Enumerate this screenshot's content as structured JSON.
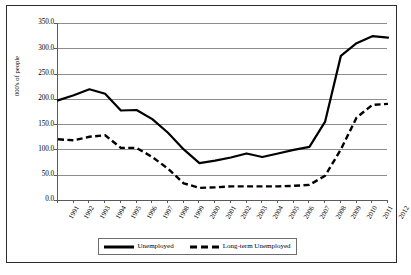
{
  "chart_data": {
    "type": "line",
    "title": "",
    "xlabel": "",
    "ylabel": "000's of people",
    "ylim": [
      0,
      350
    ],
    "ytick_step": 50,
    "grid": true,
    "legend_position": "bottom",
    "categories": [
      "1991",
      "1992",
      "1993",
      "1994",
      "1995",
      "1996",
      "1997",
      "1998",
      "1999",
      "2000",
      "2001",
      "2002",
      "2003",
      "2004",
      "2005",
      "2006",
      "2007",
      "2008",
      "2009",
      "2010",
      "2011",
      "2012"
    ],
    "ytick_labels": [
      "0.0",
      "50.0",
      "100.0",
      "150.0",
      "200.0",
      "250.0",
      "300.0",
      "350.0"
    ],
    "series": [
      {
        "name": "Unemployed",
        "style": "solid",
        "color": "#000000",
        "values": [
          197,
          207,
          219,
          210,
          177,
          178,
          160,
          133,
          100,
          73,
          78,
          84,
          92,
          85,
          92,
          99,
          105,
          155,
          285,
          310,
          324,
          321
        ]
      },
      {
        "name": "Long-term Unemployed",
        "style": "dashed",
        "color": "#000000",
        "values": [
          120,
          118,
          125,
          128,
          103,
          103,
          85,
          62,
          33,
          24,
          25,
          27,
          27,
          27,
          27,
          28,
          30,
          48,
          100,
          163,
          188,
          190
        ]
      }
    ]
  },
  "legend": {
    "entries": [
      {
        "label": "Unemployed"
      },
      {
        "label": "Long-term Unemployed"
      }
    ]
  }
}
